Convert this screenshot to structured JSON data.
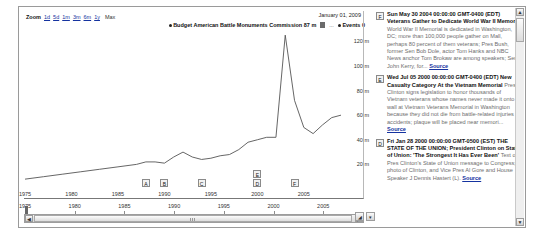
{
  "zoombar": {
    "label": "Zoom",
    "links": [
      "1d",
      "5d",
      "1m",
      "3m",
      "6m",
      "1y"
    ],
    "max_label": "Max"
  },
  "chart_header": {
    "date": "January 01, 2009"
  },
  "legend": {
    "series_label": "Budget American Battle Monuments Commission 87 m",
    "ellipsis": "...",
    "events_label": "Events 0"
  },
  "chart_data": {
    "type": "line",
    "title": "Budget American Battle Monuments Commission",
    "xlabel": "",
    "ylabel": "",
    "xlim": [
      1975,
      2009
    ],
    "ylim": [
      0,
      130
    ],
    "grid": false,
    "legend_position": "top-right",
    "yticks": [
      "120 m",
      "100 m",
      "80 m",
      "60 m",
      "40 m",
      "20 m"
    ],
    "ytick_values": [
      120,
      100,
      80,
      60,
      40,
      20
    ],
    "xticks": [
      "1975",
      "1980",
      "1985",
      "1990",
      "1995",
      "2000",
      "2005"
    ],
    "xtick_values": [
      1975,
      1980,
      1985,
      1990,
      1995,
      2000,
      2005
    ],
    "series": [
      {
        "name": "Budget American Battle Monuments Commission",
        "color": "#555555",
        "x": [
          1975,
          1977,
          1979,
          1981,
          1983,
          1985,
          1987,
          1988,
          1989,
          1990,
          1991,
          1992,
          1993,
          1994,
          1995,
          1996,
          1997,
          1998,
          1999,
          2000,
          2001,
          2002,
          2003,
          2004,
          2005,
          2006,
          2007,
          2008,
          2009
        ],
        "values": [
          8,
          10,
          12,
          14,
          16,
          18,
          20,
          22,
          22,
          21,
          26,
          30,
          26,
          24,
          25,
          27,
          28,
          32,
          38,
          40,
          42,
          42,
          125,
          72,
          50,
          45,
          52,
          58,
          60
        ]
      }
    ],
    "annotations": [
      {
        "label": "A",
        "x": 1988
      },
      {
        "label": "B",
        "x": 1990
      },
      {
        "label": "C",
        "x": 1994
      },
      {
        "label": "D",
        "x": 2000
      },
      {
        "label": "E",
        "x": 2000
      },
      {
        "label": "F",
        "x": 2004
      }
    ]
  },
  "navigator": {
    "xticks": [
      "1975",
      "1980",
      "1985",
      "1990",
      "1995",
      "2000",
      "2005"
    ],
    "xtick_values": [
      1975,
      1980,
      1985,
      1990,
      1995,
      2000,
      2005
    ]
  },
  "scrollbar": {
    "left_arrow": "◀",
    "right_arrow": "▶"
  },
  "corner_buttons": {
    "resize": "◢",
    "dropdown": "▾"
  },
  "vscrollbar": {
    "up_arrow": "▲",
    "down_arrow": "▼"
  },
  "events": [
    {
      "badge": "F",
      "datetime": "Sun May 30 2004 00:00:00 GMT-0400 (EDT)",
      "title": "Veterans Gather to Dedicate World War II Memorial",
      "description": "World War II Memorial is dedicated in Washington, DC; more than 100,000 people gather on Mall, perhaps 80 percent of them veterans; Pres Bush, former Sen Bob Dole, actor Tom Hanks and NBC News anchor Tom Brokaw are among speakers; Sen John Kerry, for...",
      "source_label": "Source"
    },
    {
      "badge": "E",
      "datetime": "Wed Jul 05 2000 00:00:00 GMT-0400 (EDT)",
      "title": "New Casualty Category At the Vietnam Memorial",
      "description": "Pres Clinton signs legislation to honor thousands of Vietnam veterans whose names never made it onto wall at Vietnam Veterans Memorial in Washington because they did not die from battle-related injuries or accidents; plaque will be placed near memori...",
      "source_label": "Source"
    },
    {
      "badge": "D",
      "datetime": "Fri Jan 28 2000 00:00:00 GMT-0500 (EST)",
      "title": "THE STATE OF THE UNION; President Clinton on State of Union: 'The Strongest It Has Ever Been'",
      "description": "Text of Pres Clinton's State of Union message to Congress; photo of Clinton, and Vice Pres Al Gore and House Speaker J Dennis Hastert (L).",
      "source_label": "Source"
    }
  ]
}
